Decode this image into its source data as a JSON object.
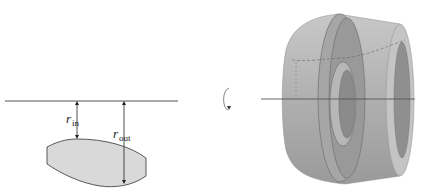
{
  "diagram": {
    "type": "solid-of-revolution-washer",
    "left_panel": {
      "axis_of_rotation": {
        "y": 101,
        "x_start": 5,
        "x_end": 178
      },
      "labels": {
        "r_in": {
          "main": "r",
          "sub": "in"
        },
        "r_out": {
          "main": "r",
          "sub": "out"
        }
      },
      "region": {
        "fill": "#d9d9d9",
        "stroke": "#333333"
      }
    },
    "rotation_symbol": {
      "icon": "rotation-arrow-icon"
    },
    "right_panel": {
      "solid": {
        "fill_light": "#cfcfcf",
        "fill_mid": "#a9a9a9",
        "fill_dark": "#8f8f8f"
      },
      "axis_of_rotation": {
        "y": 99,
        "x_start": 261,
        "x_end": 415
      }
    }
  }
}
